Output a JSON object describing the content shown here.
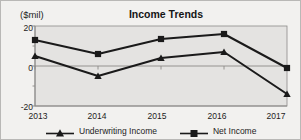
{
  "chart_data": {
    "type": "line",
    "title": "Income Trends",
    "unit_label": "($mil)",
    "xlabel": "",
    "ylabel": "",
    "categories": [
      "2013",
      "2014",
      "2015",
      "2016",
      "2017"
    ],
    "ylim": [
      -20,
      20
    ],
    "yticks": [
      20,
      0,
      -20
    ],
    "ytick_labels": [
      "20",
      "0",
      "-20"
    ],
    "yminor_ticks": [
      10,
      -10
    ],
    "grid": false,
    "zero_line": true,
    "legend_position": "bottom",
    "series": [
      {
        "name": "Underwriting Income",
        "marker": "triangle",
        "color": "#1a1a1a",
        "values": [
          5,
          -5,
          4,
          7,
          -14
        ]
      },
      {
        "name": "Net Income",
        "marker": "square",
        "color": "#1a1a1a",
        "values": [
          13,
          6,
          13.5,
          16,
          -1
        ]
      }
    ]
  },
  "colors": {
    "page_background": "#f2f1ef",
    "plot_background": "#e4e3e1",
    "axis": "#8c8b89",
    "border": "#b9b8b6",
    "text": "#1d1d1d",
    "series": "#1a1a1a"
  },
  "legend": {
    "entries": [
      {
        "label": "Underwriting Income",
        "marker": "triangle-marker"
      },
      {
        "label": "Net Income",
        "marker": "square-marker"
      }
    ]
  },
  "axis": {
    "y_labels": [
      "20",
      "0",
      "-20"
    ],
    "x_labels": [
      "2013",
      "2014",
      "2015",
      "2016",
      "2017"
    ]
  }
}
